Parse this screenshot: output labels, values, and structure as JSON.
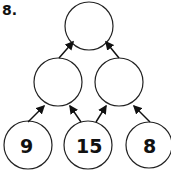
{
  "problem": {
    "label": "8.",
    "levels": {
      "top": [
        ""
      ],
      "middle": [
        "",
        ""
      ],
      "bottom": [
        "9",
        "15",
        "8"
      ]
    }
  }
}
